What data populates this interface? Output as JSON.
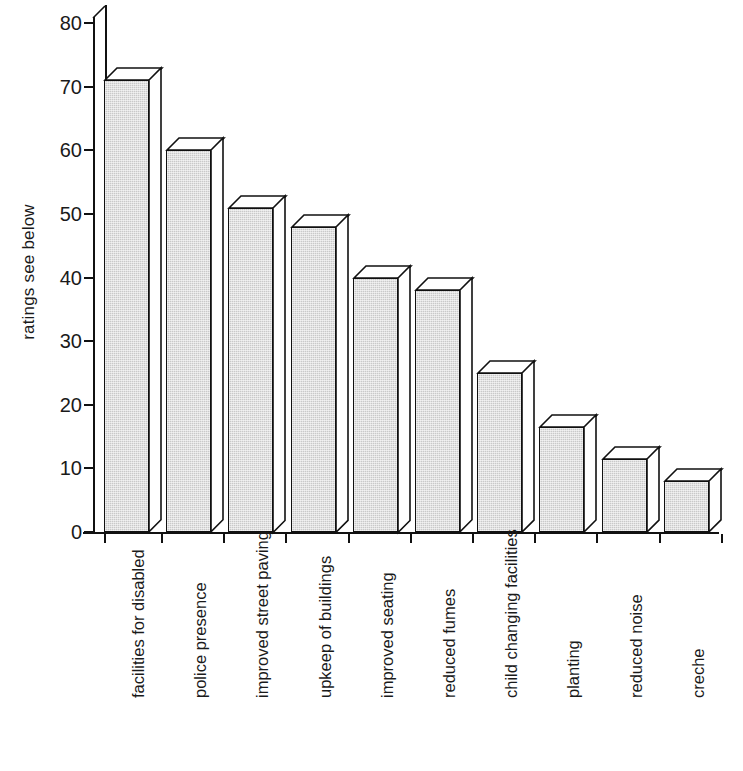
{
  "chart_data": {
    "type": "bar",
    "title": "",
    "xlabel": "",
    "ylabel": "ratings see below",
    "ylim": [
      0,
      80
    ],
    "ytick_values": [
      0,
      10,
      20,
      30,
      40,
      50,
      60,
      70,
      80
    ],
    "ytick_labels": [
      "0",
      "10",
      "20",
      "30",
      "40",
      "50",
      "60",
      "70",
      "80"
    ],
    "grid": false,
    "legend": "none",
    "style": "3d-column",
    "bar_fill_color": "#c9c9c9",
    "bar_outline_color": "#111111",
    "categories": [
      "facilities for disabled",
      "police presence",
      "improved street paving",
      "upkeep of buildings",
      "improved seating",
      "reduced fumes",
      "child changing facilities",
      "planting",
      "reduced noise",
      "creche"
    ],
    "values": [
      71,
      60,
      51,
      48,
      40,
      38,
      25,
      16.5,
      11.5,
      8
    ]
  }
}
